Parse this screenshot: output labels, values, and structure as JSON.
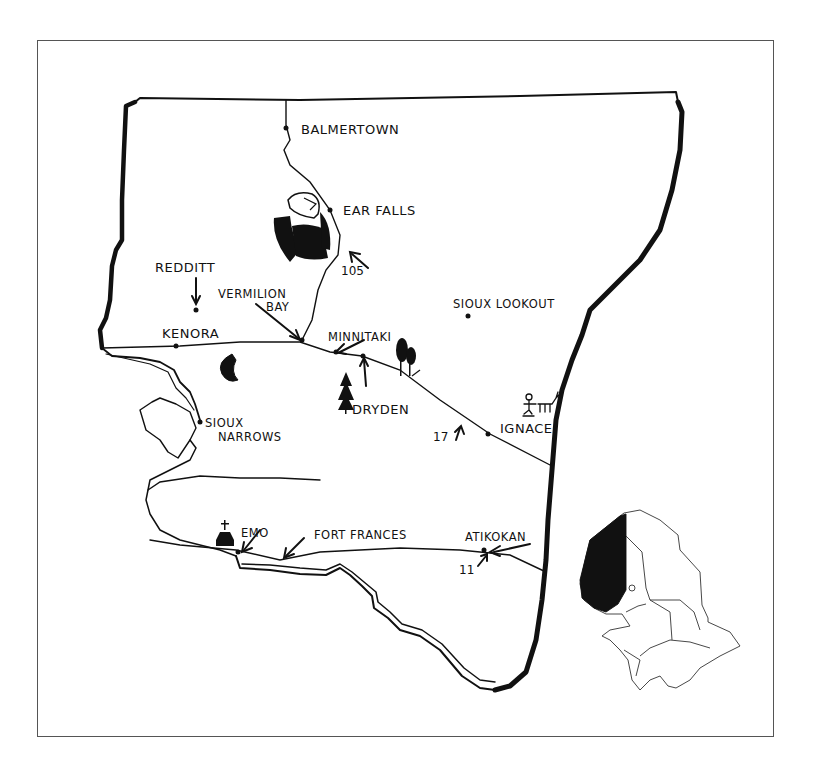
{
  "map": {
    "title": "",
    "region": "Northwestern Ontario (Kenora / Rainy River)",
    "colors": {
      "ink": "#111111",
      "frame": "#555555",
      "background": "#ffffff"
    }
  },
  "places": [
    {
      "id": "balmertown",
      "label": "BALMERTOWN"
    },
    {
      "id": "ear-falls",
      "label": "EAR FALLS"
    },
    {
      "id": "redditt",
      "label": "REDDITT"
    },
    {
      "id": "vermilion-bay",
      "label": "VERMILION",
      "label2": "BAY"
    },
    {
      "id": "kenora",
      "label": "KENORA"
    },
    {
      "id": "minnitaki",
      "label": "MINNITAKI"
    },
    {
      "id": "sioux-lookout",
      "label": "SIOUX LOOKOUT"
    },
    {
      "id": "dryden",
      "label": "DRYDEN"
    },
    {
      "id": "ignace",
      "label": "IGNACE"
    },
    {
      "id": "sioux-narrows",
      "label": "SIOUX",
      "label2": "NARROWS"
    },
    {
      "id": "emo",
      "label": "EMO"
    },
    {
      "id": "fort-frances",
      "label": "FORT FRANCES"
    },
    {
      "id": "atikokan",
      "label": "ATIKOKAN"
    }
  ],
  "routes": [
    {
      "id": "hwy-105",
      "label": "105"
    },
    {
      "id": "hwy-17",
      "label": "17"
    },
    {
      "id": "hwy-11",
      "label": "11"
    }
  ],
  "icons": [
    "eagle-icon",
    "fish-icon",
    "tree-icon",
    "trees-icon",
    "church-icon",
    "hunter-deer-icon"
  ],
  "inset": {
    "label": "Ontario locator map",
    "highlighted_region": "Northwestern Ontario"
  }
}
